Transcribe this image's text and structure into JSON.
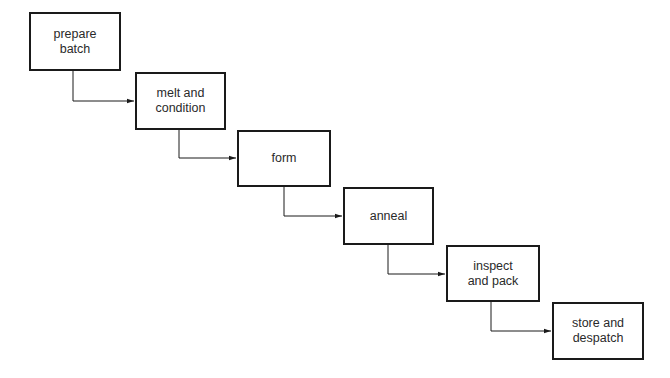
{
  "diagram": {
    "type": "flowchart",
    "direction": "top-left to bottom-right staircase",
    "colors": {
      "stroke": "#1a1a1a",
      "text": "#2a2a2a",
      "background": "#ffffff"
    },
    "steps": [
      {
        "label": "prepare\nbatch",
        "x": 29,
        "y": 12,
        "w": 92,
        "h": 59
      },
      {
        "label": "melt and\ncondition",
        "x": 135,
        "y": 72,
        "w": 91,
        "h": 58
      },
      {
        "label": "form",
        "x": 237,
        "y": 130,
        "w": 94,
        "h": 57
      },
      {
        "label": "anneal",
        "x": 343,
        "y": 187,
        "w": 91,
        "h": 58
      },
      {
        "label": "inspect\nand pack",
        "x": 446,
        "y": 245,
        "w": 94,
        "h": 57
      },
      {
        "label": "store and\ndespatch",
        "x": 552,
        "y": 302,
        "w": 92,
        "h": 58
      }
    ],
    "connectors": [
      {
        "from": 0,
        "to": 1,
        "x": 73,
        "y1": 71,
        "y2": 101,
        "x2": 135
      },
      {
        "from": 1,
        "to": 2,
        "x": 179,
        "y1": 130,
        "y2": 158,
        "x2": 237
      },
      {
        "from": 2,
        "to": 3,
        "x": 284,
        "y1": 187,
        "y2": 216,
        "x2": 343
      },
      {
        "from": 3,
        "to": 4,
        "x": 388,
        "y1": 245,
        "y2": 274,
        "x2": 446
      },
      {
        "from": 4,
        "to": 5,
        "x": 491,
        "y1": 302,
        "y2": 331,
        "x2": 552
      }
    ]
  }
}
